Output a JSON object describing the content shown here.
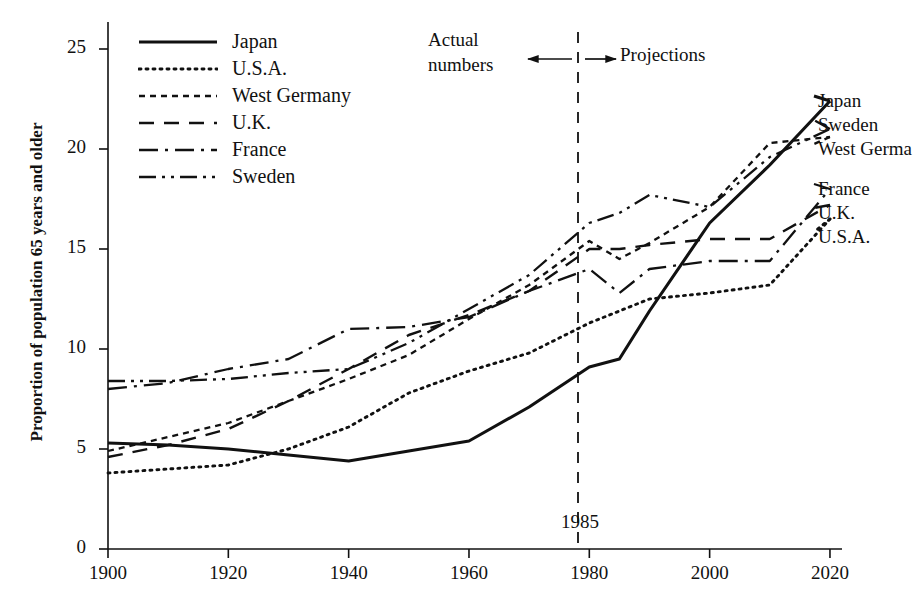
{
  "chart_data": {
    "type": "line",
    "title": "",
    "xlabel": "",
    "ylabel": "Proportion of population 65 years and older",
    "xlim": [
      1900,
      2022
    ],
    "ylim": [
      0,
      26.5
    ],
    "xticks": [
      1900,
      1920,
      1940,
      1960,
      1980,
      2000,
      2020
    ],
    "yticks": [
      0,
      5,
      10,
      15,
      20,
      25
    ],
    "grid": false,
    "legend_position": "upper-left-inside",
    "annotations": [
      {
        "name": "actual-numbers",
        "text": "Actual\nnumbers",
        "arrow": "left"
      },
      {
        "name": "projections",
        "text": "Projections",
        "arrow": "right"
      },
      {
        "name": "year-marker",
        "text": "1985",
        "x": 1985,
        "style": "dashed-vertical"
      }
    ],
    "series": [
      {
        "name": "Japan",
        "style": "solid",
        "x": [
          1900,
          1910,
          1920,
          1930,
          1940,
          1950,
          1960,
          1970,
          1980,
          1985,
          1990,
          2000,
          2010,
          2020
        ],
        "values": [
          5.3,
          5.2,
          5.0,
          4.7,
          4.4,
          4.9,
          5.4,
          7.1,
          9.1,
          9.5,
          11.9,
          16.3,
          19.2,
          22.4
        ]
      },
      {
        "name": "U.S.A.",
        "style": "dotted",
        "x": [
          1900,
          1910,
          1920,
          1930,
          1940,
          1950,
          1960,
          1970,
          1980,
          1985,
          1990,
          2000,
          2010,
          2020
        ],
        "values": [
          3.8,
          4.0,
          4.2,
          5.0,
          6.1,
          7.8,
          8.9,
          9.8,
          11.3,
          11.9,
          12.5,
          12.8,
          13.2,
          16.5
        ]
      },
      {
        "name": "West Germany",
        "style": "fine-dashed",
        "x": [
          1900,
          1910,
          1920,
          1930,
          1940,
          1950,
          1960,
          1970,
          1980,
          1985,
          1990,
          2000,
          2010,
          2020
        ],
        "values": [
          4.9,
          5.6,
          6.3,
          7.4,
          8.5,
          9.7,
          11.5,
          13.2,
          15.4,
          14.5,
          15.3,
          17.1,
          20.3,
          20.6
        ]
      },
      {
        "name": "U.K.",
        "style": "dashed",
        "x": [
          1900,
          1910,
          1920,
          1930,
          1940,
          1950,
          1960,
          1970,
          1980,
          1985,
          1990,
          2000,
          2010,
          2020
        ],
        "values": [
          4.6,
          5.2,
          6.0,
          7.4,
          9.0,
          10.7,
          11.7,
          12.9,
          15.0,
          15.0,
          15.2,
          15.5,
          15.5,
          17.2
        ]
      },
      {
        "name": "France",
        "style": "dash-dot",
        "x": [
          1900,
          1910,
          1920,
          1930,
          1940,
          1950,
          1960,
          1970,
          1980,
          1985,
          1990,
          2000,
          2010,
          2020
        ],
        "values": [
          8.0,
          8.3,
          9.0,
          9.5,
          11.0,
          11.1,
          11.6,
          12.9,
          14.0,
          12.8,
          14.0,
          14.4,
          14.4,
          18.0
        ]
      },
      {
        "name": "Sweden",
        "style": "dash-dot-dot",
        "x": [
          1900,
          1910,
          1920,
          1930,
          1940,
          1950,
          1960,
          1970,
          1980,
          1985,
          1990,
          2000,
          2010,
          2020
        ],
        "values": [
          8.4,
          8.4,
          8.5,
          8.8,
          9.0,
          10.3,
          12.0,
          13.7,
          16.3,
          16.8,
          17.7,
          17.1,
          19.6,
          21.0
        ]
      }
    ],
    "end_labels": [
      {
        "name": "Japan",
        "value": 22.4
      },
      {
        "name": "Sweden",
        "value": 21.0
      },
      {
        "name": "West Germa",
        "value": 20.6
      },
      {
        "name": "France",
        "value": 18.0
      },
      {
        "name": "U.K.",
        "value": 17.2
      },
      {
        "name": "U.S.A.",
        "value": 16.5
      }
    ]
  },
  "axis": {
    "y_label": "Proportion of population 65 years and older",
    "y_ticks": [
      "25",
      "20",
      "15",
      "10",
      "5",
      "0"
    ],
    "x_ticks": [
      "1900",
      "1920",
      "1940",
      "1960",
      "1980",
      "2000",
      "2020"
    ]
  },
  "legend": {
    "items": [
      {
        "label": "Japan",
        "style": "solid"
      },
      {
        "label": "U.S.A.",
        "style": "dotted"
      },
      {
        "label": "West Germany",
        "style": "fine-dashed"
      },
      {
        "label": "U.K.",
        "style": "dashed"
      },
      {
        "label": "France",
        "style": "dash-dot"
      },
      {
        "label": "Sweden",
        "style": "dash-dot-dot"
      }
    ]
  },
  "annotations": {
    "actual_line1": "Actual",
    "actual_line2": "numbers",
    "projections": "Projections",
    "year_marker": "1985"
  },
  "end_labels": {
    "japan": "Japan",
    "sweden": "Sweden",
    "west_germany": "West Germa",
    "france": "France",
    "uk": "U.K.",
    "usa": "U.S.A."
  },
  "colors": {
    "ink": "#111111",
    "background": "#ffffff"
  }
}
